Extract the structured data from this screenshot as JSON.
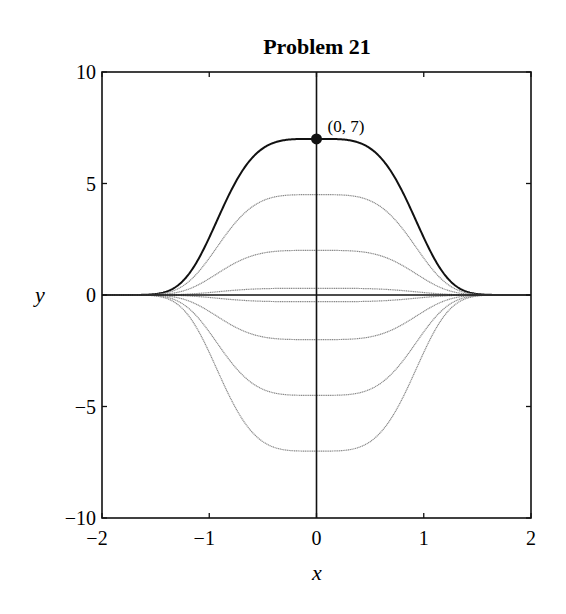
{
  "chart_data": {
    "type": "line",
    "title": "Problem 21",
    "xlabel": "x",
    "ylabel": "y",
    "xlim": [
      -2,
      2
    ],
    "ylim": [
      -10,
      10
    ],
    "xticks": [
      -2,
      -1,
      0,
      1,
      2
    ],
    "yticks": [
      -10,
      -5,
      0,
      5,
      10
    ],
    "xtick_labels": [
      "−2",
      "−1",
      "0",
      "1",
      "2"
    ],
    "ytick_labels": [
      "−10",
      "−5",
      "0",
      "5",
      "10"
    ],
    "grid": false,
    "legend": null,
    "family": "y = C·exp(−x⁴)",
    "series": [
      {
        "name": "C = 7 (highlighted solution)",
        "C": 7,
        "highlight": true
      },
      {
        "name": "C = 4.5",
        "C": 4.5,
        "highlight": false
      },
      {
        "name": "C = 2",
        "C": 2,
        "highlight": false
      },
      {
        "name": "C = 0.3",
        "C": 0.3,
        "highlight": false
      },
      {
        "name": "C = -0.3",
        "C": -0.3,
        "highlight": false
      },
      {
        "name": "C = -2",
        "C": -2,
        "highlight": false
      },
      {
        "name": "C = -4.5",
        "C": -4.5,
        "highlight": false
      },
      {
        "name": "C = -7",
        "C": -7,
        "highlight": false
      }
    ],
    "annotations": [
      {
        "text": "(0, 7)",
        "x": 0,
        "y": 7,
        "marker": "filled-circle"
      }
    ]
  },
  "colors": {
    "highlight": "#111111",
    "family": "#8a8a8a",
    "axes": "#111111"
  }
}
